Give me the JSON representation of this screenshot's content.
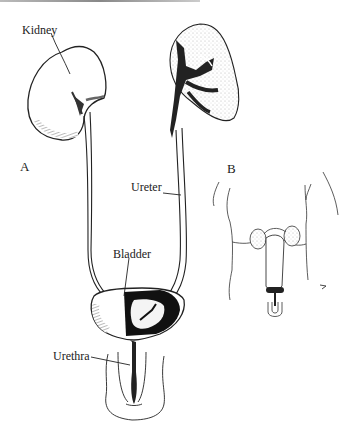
{
  "figure": {
    "panels": [
      {
        "id": "A",
        "label": "A"
      },
      {
        "id": "B",
        "label": "B"
      }
    ],
    "labels": {
      "kidney": "Kidney",
      "ureter": "Ureter",
      "bladder": "Bladder",
      "urethra": "Urethra"
    },
    "colors": {
      "ink": "#222222",
      "background": "#ffffff",
      "stipple": "#bbbbbb"
    }
  }
}
